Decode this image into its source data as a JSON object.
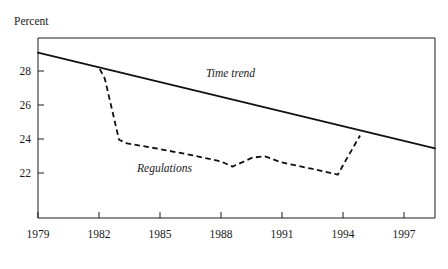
{
  "chart_data": {
    "type": "line",
    "title": "",
    "subtitle": "",
    "ylabel": "Percent",
    "xlabel": "",
    "grid": false,
    "legend_position": "inline-annotations",
    "xlim": [
      1979,
      1998.6
    ],
    "ylim": [
      20.9,
      29.3
    ],
    "x_ticks": [
      1979,
      1982,
      1985,
      1988,
      1991,
      1994,
      1997
    ],
    "x_tick_labels": [
      "1979",
      "1982",
      "1985",
      "1988",
      "1991",
      "1994",
      "1997"
    ],
    "y_ticks": [
      22,
      24,
      26,
      28
    ],
    "y_tick_labels": [
      "22",
      "24",
      "26",
      "28"
    ],
    "annotations": [
      {
        "text": "Time trend",
        "x": 1988.0,
        "y": 26.7
      },
      {
        "text": "Regulations",
        "x": 1984.6,
        "y": 23.5
      }
    ],
    "series": [
      {
        "name": "Time trend",
        "style": "solid",
        "x": [
          1979,
          1998.6
        ],
        "values": [
          28.62,
          24.15
        ]
      },
      {
        "name": "Regulations",
        "style": "dashed",
        "x": [
          1982.05,
          1982.3,
          1983.0,
          1983.4,
          1985.0,
          1986.5,
          1988.0,
          1988.6,
          1989.6,
          1990.2,
          1991.0,
          1992.5,
          1993.8,
          1994.2,
          1994.9
        ],
        "values": [
          27.85,
          27.4,
          24.55,
          24.38,
          24.12,
          23.85,
          23.55,
          23.3,
          23.72,
          23.78,
          23.5,
          23.2,
          22.92,
          23.6,
          24.75
        ]
      }
    ]
  },
  "y_axis": {
    "label": "Percent"
  }
}
